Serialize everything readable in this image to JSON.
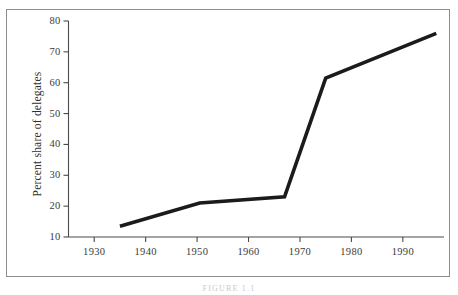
{
  "chart_data": {
    "type": "line",
    "title": "",
    "subtitle": "",
    "xlabel": "",
    "ylabel": "Percent share of delegates",
    "xlim": [
      1925,
      1998
    ],
    "ylim": [
      10,
      80
    ],
    "grid": false,
    "legend": null,
    "annotations": [],
    "x_ticks": [
      1930,
      1940,
      1950,
      1960,
      1970,
      1980,
      1990
    ],
    "x_tick_labels": [
      "1930",
      "1940",
      "1950",
      "1960",
      "1970",
      "1980",
      "1990"
    ],
    "y_ticks": [
      10,
      20,
      30,
      40,
      50,
      60,
      70,
      80
    ],
    "y_tick_labels": [
      "10",
      "20",
      "30",
      "40",
      "50",
      "60",
      "70",
      "80"
    ],
    "series": [
      {
        "name": "Percent share of delegates",
        "color": "#1b1b1b",
        "x": [
          1935,
          1950.5,
          1967,
          1975,
          1996.5
        ],
        "values": [
          13.5,
          21.0,
          23.0,
          61.5,
          76.0
        ]
      }
    ]
  },
  "figure": {
    "caption": "FIGURE 1.1"
  },
  "axis": {
    "y_title": "Percent share of delegates"
  },
  "style": {
    "line_color": "#1b1b1b",
    "axis_color": "#4a4a4a",
    "frame_color": "#8d8d8d",
    "background": "#ffffff",
    "text_color": "#3a3a3a"
  }
}
